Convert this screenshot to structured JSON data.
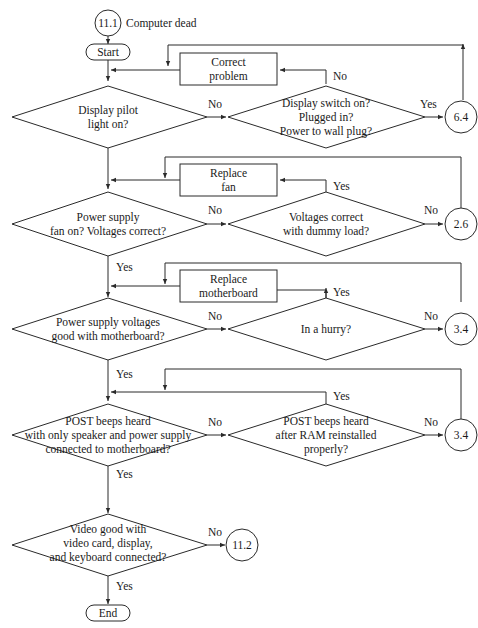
{
  "diagram": {
    "title_connector": {
      "label": "11.1",
      "caption": "Computer dead"
    },
    "start": {
      "label": "Start"
    },
    "end": {
      "label": "End"
    },
    "rows": [
      {
        "decision": [
          "Display pilot",
          "light on?"
        ],
        "no_label": "No",
        "check": [
          "Display switch on?",
          "Plugged in?",
          "Power to wall plug?"
        ],
        "check_up_label": "No",
        "check_right_label": "Yes",
        "action": [
          "Correct",
          "problem"
        ],
        "connector": "6.4"
      },
      {
        "decision": [
          "Power supply",
          "fan on? Voltages correct?"
        ],
        "no_label": "No",
        "down_label": "Yes",
        "check": [
          "Voltages correct",
          "with dummy load?"
        ],
        "check_up_label": "Yes",
        "check_right_label": "No",
        "action": [
          "Replace",
          "fan"
        ],
        "connector": "2.6"
      },
      {
        "decision": [
          "Power supply voltages",
          "good with motherboard?"
        ],
        "no_label": "No",
        "down_label": "Yes",
        "check": [
          "In a hurry?"
        ],
        "check_up_label": "Yes",
        "check_right_label": "No",
        "action": [
          "Replace",
          "motherboard"
        ],
        "connector": "3.4"
      },
      {
        "decision": [
          "POST beeps heard",
          "with only speaker and power supply",
          "connected to motherboard?"
        ],
        "no_label": "No",
        "down_label": "Yes",
        "check": [
          "POST beeps heard",
          "after RAM reinstalled",
          "properly?"
        ],
        "check_up_label": "Yes",
        "check_right_label": "No",
        "connector": "3.4"
      },
      {
        "decision": [
          "Video good with",
          "video card, display,",
          "and keyboard connected?"
        ],
        "no_label": "No",
        "down_label": "Yes",
        "connector": "11.2"
      }
    ]
  }
}
